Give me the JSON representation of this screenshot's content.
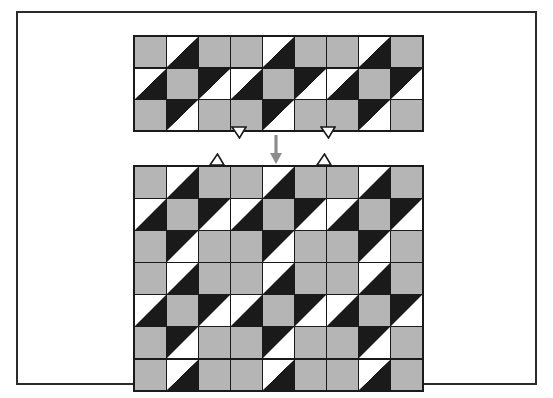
{
  "figure": {
    "background_color": "#ffffff",
    "frame": {
      "border_color": "#2b2b2b",
      "border_width": 2
    },
    "palette": {
      "gray": "#b5b5b5",
      "black": "#1a1a1a",
      "white": "#ffffff",
      "arrow": "#8c8c8c",
      "grid_line": "#1a1a1a"
    },
    "cell_legend": {
      "gray": "solid gray square",
      "tri-wb": "white upper-left triangle, black lower-right triangle",
      "tri-bw": "black upper-left triangle, white lower-right triangle"
    },
    "arrow": {
      "direction": "down",
      "color": "#8c8c8c",
      "label": ""
    },
    "notches": [
      {
        "name": "top-grid-left-tab",
        "shape": "v-notch-down",
        "anchor": "top-grid-bottom-edge"
      },
      {
        "name": "top-grid-right-tab",
        "shape": "v-notch-down",
        "anchor": "top-grid-bottom-edge"
      },
      {
        "name": "bottom-grid-left-tab",
        "shape": "triangle-tab-up",
        "anchor": "bottom-grid-top-edge"
      },
      {
        "name": "bottom-grid-right-tab",
        "shape": "triangle-tab-up",
        "anchor": "bottom-grid-top-edge"
      }
    ]
  },
  "grids": {
    "top": {
      "name": "source-tile-strip",
      "columns": 9,
      "rows": 3,
      "cells": [
        [
          "gray",
          "tri-wb",
          "gray",
          "gray",
          "tri-wb",
          "gray",
          "gray",
          "tri-wb",
          "gray"
        ],
        [
          "tri-wb",
          "gray",
          "tri-bw",
          "tri-wb",
          "gray",
          "tri-bw",
          "tri-wb",
          "gray",
          "tri-bw"
        ],
        [
          "gray",
          "tri-bw",
          "gray",
          "gray",
          "tri-bw",
          "gray",
          "gray",
          "tri-bw",
          "gray"
        ]
      ]
    },
    "bottom": {
      "name": "extended-tile-field",
      "columns": 9,
      "rows": 7,
      "cells": [
        [
          "gray",
          "tri-wb",
          "gray",
          "gray",
          "tri-wb",
          "gray",
          "gray",
          "tri-wb",
          "gray"
        ],
        [
          "tri-wb",
          "gray",
          "tri-bw",
          "tri-wb",
          "gray",
          "tri-bw",
          "tri-wb",
          "gray",
          "tri-bw"
        ],
        [
          "gray",
          "tri-bw",
          "gray",
          "gray",
          "tri-bw",
          "gray",
          "gray",
          "tri-bw",
          "gray"
        ],
        [
          "gray",
          "tri-wb",
          "gray",
          "gray",
          "tri-wb",
          "gray",
          "gray",
          "tri-wb",
          "gray"
        ],
        [
          "tri-wb",
          "gray",
          "tri-bw",
          "tri-wb",
          "gray",
          "tri-bw",
          "tri-wb",
          "gray",
          "tri-bw"
        ],
        [
          "gray",
          "tri-bw",
          "gray",
          "gray",
          "tri-bw",
          "gray",
          "gray",
          "tri-bw",
          "gray"
        ],
        [
          "gray",
          "tri-wb",
          "gray",
          "gray",
          "tri-wb",
          "gray",
          "gray",
          "tri-wb",
          "gray"
        ]
      ]
    }
  }
}
